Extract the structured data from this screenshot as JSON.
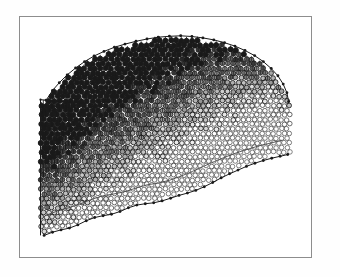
{
  "figure": {
    "title": "",
    "kind": "marker-lattice-surface-density-plot",
    "background_color": "#ffffff",
    "frame": {
      "name": "plot-frame",
      "x": 19,
      "y": 16,
      "width": 293,
      "height": 242,
      "stroke_color": "#8d8d8d",
      "stroke_width": 1,
      "fill_color": "#ffffff"
    },
    "ink_color": "#1a1a1a",
    "light_ink_color": "#4a4a4a"
  },
  "chart_data": {
    "type": "scatter",
    "title": "",
    "xlabel": "",
    "ylabel": "",
    "grid": false,
    "legend": "none",
    "xlim": [
      0,
      1
    ],
    "ylim": [
      0,
      1
    ],
    "marker": {
      "shape": "circle",
      "radius_px": 2.6,
      "spacing_px": 5.4,
      "row_offset_px": 2.7
    },
    "density_field": {
      "note": "fill opacity 0..1 as function of normalized position; 1 = solid black, 0 = open ring",
      "max_at": [
        0.26,
        0.8
      ],
      "min_at": [
        0.93,
        0.36
      ],
      "gradient_axis_deg": -32
    },
    "boundaries": [
      {
        "name": "top-ridge",
        "style": "dotted-polyline",
        "marker": "small-filled-dot",
        "points": [
          [
            0.075,
            0.66
          ],
          [
            0.098,
            0.702
          ],
          [
            0.122,
            0.736
          ],
          [
            0.15,
            0.77
          ],
          [
            0.18,
            0.8
          ],
          [
            0.212,
            0.828
          ],
          [
            0.246,
            0.852
          ],
          [
            0.281,
            0.872
          ],
          [
            0.318,
            0.89
          ],
          [
            0.356,
            0.904
          ],
          [
            0.395,
            0.916
          ],
          [
            0.434,
            0.926
          ],
          [
            0.474,
            0.934
          ],
          [
            0.514,
            0.938
          ],
          [
            0.554,
            0.94
          ],
          [
            0.594,
            0.937
          ],
          [
            0.633,
            0.931
          ],
          [
            0.672,
            0.922
          ],
          [
            0.71,
            0.91
          ],
          [
            0.747,
            0.895
          ],
          [
            0.783,
            0.876
          ],
          [
            0.817,
            0.854
          ],
          [
            0.848,
            0.828
          ],
          [
            0.876,
            0.798
          ],
          [
            0.9,
            0.766
          ],
          [
            0.919,
            0.73
          ],
          [
            0.932,
            0.692
          ],
          [
            0.938,
            0.654
          ]
        ]
      },
      {
        "name": "bottom-edge",
        "style": "dotted-polyline",
        "marker": "small-filled-dot",
        "points": [
          [
            0.068,
            0.072
          ],
          [
            0.098,
            0.086
          ],
          [
            0.128,
            0.096
          ],
          [
            0.158,
            0.104
          ],
          [
            0.188,
            0.118
          ],
          [
            0.218,
            0.136
          ],
          [
            0.248,
            0.15
          ],
          [
            0.278,
            0.158
          ],
          [
            0.308,
            0.164
          ],
          [
            0.338,
            0.176
          ],
          [
            0.368,
            0.192
          ],
          [
            0.398,
            0.204
          ],
          [
            0.428,
            0.21
          ],
          [
            0.458,
            0.214
          ],
          [
            0.488,
            0.222
          ],
          [
            0.518,
            0.234
          ],
          [
            0.548,
            0.246
          ],
          [
            0.578,
            0.256
          ],
          [
            0.608,
            0.268
          ],
          [
            0.638,
            0.284
          ],
          [
            0.668,
            0.302
          ],
          [
            0.698,
            0.322
          ],
          [
            0.728,
            0.34
          ],
          [
            0.758,
            0.356
          ],
          [
            0.788,
            0.372
          ],
          [
            0.818,
            0.386
          ],
          [
            0.848,
            0.398
          ],
          [
            0.878,
            0.408
          ],
          [
            0.908,
            0.416
          ],
          [
            0.935,
            0.424
          ]
        ]
      },
      {
        "name": "inner-lower-contour",
        "style": "thin-polyline",
        "points": [
          [
            0.075,
            0.16
          ],
          [
            0.115,
            0.178
          ],
          [
            0.155,
            0.192
          ],
          [
            0.195,
            0.208
          ],
          [
            0.235,
            0.228
          ],
          [
            0.275,
            0.244
          ],
          [
            0.315,
            0.252
          ],
          [
            0.355,
            0.262
          ],
          [
            0.395,
            0.278
          ],
          [
            0.435,
            0.292
          ],
          [
            0.475,
            0.3
          ],
          [
            0.515,
            0.312
          ],
          [
            0.555,
            0.33
          ],
          [
            0.595,
            0.35
          ],
          [
            0.635,
            0.372
          ],
          [
            0.675,
            0.394
          ],
          [
            0.715,
            0.414
          ],
          [
            0.755,
            0.432
          ],
          [
            0.795,
            0.448
          ],
          [
            0.835,
            0.462
          ],
          [
            0.875,
            0.474
          ],
          [
            0.915,
            0.486
          ]
        ]
      }
    ],
    "left_cut_face": {
      "name": "hatched-cut-face",
      "style": "vertical-hatch",
      "x_range": [
        0.055,
        0.175
      ],
      "top_y": 0.662,
      "bottom_y": 0.3,
      "line_count": 13,
      "cap_line": true
    }
  }
}
